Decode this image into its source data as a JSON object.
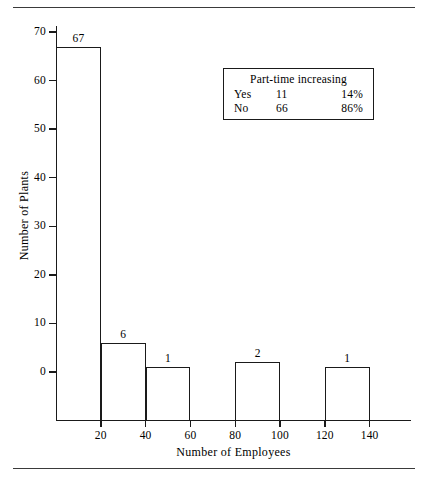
{
  "chart_data": {
    "type": "bar",
    "title": "",
    "xlabel": "Number of Employees",
    "ylabel": "Number of Plants",
    "categories": [
      "0-20",
      "20-40",
      "40-60",
      "60-80",
      "80-100",
      "100-120",
      "120-140"
    ],
    "bin_edges": [
      0,
      20,
      40,
      60,
      80,
      100,
      120,
      140
    ],
    "values": [
      67,
      6,
      1,
      0,
      2,
      0,
      1
    ],
    "bar_labels": [
      "67",
      "6",
      "1",
      "",
      "2",
      "",
      "1"
    ],
    "x_ticks": [
      20,
      40,
      60,
      80,
      100,
      120,
      140
    ],
    "x_tick_labels": [
      "20",
      "40",
      "60",
      "80",
      "100",
      "120",
      "140"
    ],
    "y_ticks": [
      0,
      10,
      20,
      30,
      40,
      50,
      60,
      70
    ],
    "y_tick_labels": [
      "0",
      "10",
      "20",
      "30",
      "40",
      "50",
      "60",
      "70"
    ],
    "xlim": [
      0,
      158
    ],
    "ylim": [
      0,
      73
    ],
    "grid": false,
    "legend_position": "upper right",
    "style": "outlined bars, no fill",
    "line_color": "#1a1a1a"
  },
  "annotation_table": {
    "title": "Part-time increasing",
    "rows": [
      {
        "label": "Yes",
        "count": "11",
        "percent": "14%"
      },
      {
        "label": "No",
        "count": "66",
        "percent": "86%"
      }
    ]
  }
}
